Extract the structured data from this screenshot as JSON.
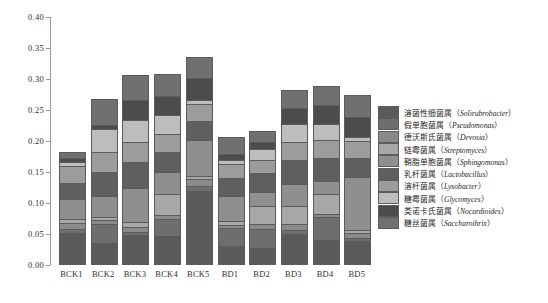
{
  "chart_data": {
    "type": "bar",
    "stacked": true,
    "title": "",
    "xlabel": "",
    "ylabel": "相对丰度",
    "ylim": [
      0.0,
      0.4
    ],
    "ytick_labels": [
      "0.00",
      "0.05",
      "0.10",
      "0.15",
      "0.20",
      "0.25",
      "0.30",
      "0.35",
      "0.40"
    ],
    "ytick_values": [
      0.0,
      0.05,
      0.1,
      0.15,
      0.2,
      0.25,
      0.3,
      0.35,
      0.4
    ],
    "grid": false,
    "legend_position": "right",
    "categories": [
      "BCK1",
      "BCK2",
      "BCK3",
      "BCK4",
      "BCK5",
      "BD1",
      "BD2",
      "BD3",
      "BD4",
      "BD5"
    ],
    "series": [
      {
        "name": "溶菌性细菌属（Solirubrobacter）",
        "name_cn": "溶菌性细菌属",
        "name_sci": "Solirubrobacter",
        "color": "#5a5a5a",
        "values": [
          0.052,
          0.036,
          0.049,
          0.046,
          0.12,
          0.03,
          0.028,
          0.05,
          0.04,
          0.038
        ]
      },
      {
        "name": "假单胞菌属（Pseudomonas）",
        "name_cn": "假单胞菌属",
        "name_sci": "Pseudomonas",
        "color": "#6e6e6e",
        "values": [
          0.006,
          0.03,
          0.005,
          0.029,
          0.008,
          0.029,
          0.03,
          0.006,
          0.037,
          0.005
        ]
      },
      {
        "name": "德沃斯氏菌属（Devosia）",
        "name_cn": "德沃斯氏菌属",
        "name_sci": "Devosia",
        "color": "#8a8a8a",
        "values": [
          0.01,
          0.006,
          0.008,
          0.005,
          0.01,
          0.006,
          0.008,
          0.01,
          0.006,
          0.008
        ]
      },
      {
        "name": "链霉菌属（Streptomyces）",
        "name_cn": "链霉菌属",
        "name_sci": "Streptomyces",
        "color": "#a8a8a8",
        "values": [
          0.007,
          0.005,
          0.007,
          0.034,
          0.005,
          0.006,
          0.03,
          0.03,
          0.032,
          0.006
        ]
      },
      {
        "name": "鞘脂单胞菌属（Sphingomonas）",
        "name_cn": "鞘脂单胞菌属",
        "name_sci": "Sphingomonas",
        "color": "#8f8f8f",
        "values": [
          0.032,
          0.034,
          0.056,
          0.036,
          0.059,
          0.04,
          0.022,
          0.034,
          0.021,
          0.085
        ]
      },
      {
        "name": "乳杆菌属（Lactobacillus）",
        "name_cn": "乳杆菌属",
        "name_sci": "Lactobacillus",
        "color": "#5f5f5f",
        "values": [
          0.025,
          0.039,
          0.042,
          0.032,
          0.03,
          0.03,
          0.03,
          0.04,
          0.036,
          0.03
        ]
      },
      {
        "name": "溶杆菌属（Lysobacter）",
        "name_cn": "溶杆菌属",
        "name_sci": "Lysobacter",
        "color": "#9c9c9c",
        "values": [
          0.028,
          0.032,
          0.031,
          0.029,
          0.028,
          0.022,
          0.022,
          0.028,
          0.03,
          0.028
        ]
      },
      {
        "name": "糖霉菌属（Glycomyces）",
        "name_cn": "糖霉菌属",
        "name_sci": "Glycomyces",
        "color": "#bdbdbd",
        "values": [
          0.006,
          0.038,
          0.036,
          0.031,
          0.006,
          0.006,
          0.018,
          0.03,
          0.025,
          0.007
        ]
      },
      {
        "name": "类诺卡氏菌属（Nocardioides）",
        "name_cn": "类诺卡氏菌属",
        "name_sci": "Nocardioides",
        "color": "#4c4c4c",
        "values": [
          0.007,
          0.006,
          0.033,
          0.03,
          0.035,
          0.01,
          0.01,
          0.025,
          0.031,
          0.032
        ]
      },
      {
        "name": "糖丝菌属（Saccharothrix）",
        "name_cn": "糖丝菌属",
        "name_sci": "Saccharothrix",
        "color": "#707070",
        "values": [
          0.01,
          0.042,
          0.04,
          0.036,
          0.035,
          0.028,
          0.018,
          0.03,
          0.03,
          0.035
        ]
      }
    ],
    "totals": [
      0.183,
      0.268,
      0.307,
      0.308,
      0.336,
      0.207,
      0.216,
      0.283,
      0.288,
      0.274
    ]
  }
}
